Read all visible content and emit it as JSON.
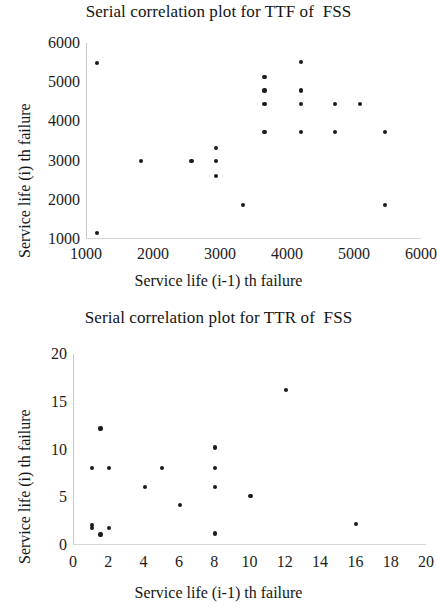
{
  "page": {
    "background": "#ffffff",
    "marker_color": "#1b1b1b",
    "axis_color": "#c9c9c9",
    "text_color": "#1a1a1a"
  },
  "figures": [
    {
      "id": "ttf",
      "title": "Serial correlation plot for TTF of  FSS",
      "xlabel": "Service life (i-1) th failure",
      "ylabel": "Service life (i) th failure"
    },
    {
      "id": "ttr",
      "title": "Serial correlation plot for TTR of  FSS",
      "xlabel": "Service life (i-1) th failure",
      "ylabel": "Service life (i) th failure"
    }
  ],
  "chart_data": [
    {
      "type": "scatter",
      "title": "Serial correlation plot for TTF of  FSS",
      "xlabel": "Service life (i-1) th failure",
      "ylabel": "Service life (i) th failure",
      "xlim": [
        1000,
        6000
      ],
      "ylim": [
        1000,
        6000
      ],
      "xticks": [
        1000,
        2000,
        3000,
        4000,
        5000,
        6000
      ],
      "yticks": [
        1000,
        2000,
        3000,
        4000,
        5000,
        6000
      ],
      "xticklabels": [
        "1000",
        "2000",
        "3000",
        "4000",
        "5000",
        "6000"
      ],
      "yticklabels": [
        "1000",
        "2000",
        "3000",
        "4000",
        "5000",
        "6000"
      ],
      "grid": false,
      "legend": null,
      "points": [
        [
          1150,
          5500
        ],
        [
          1150,
          1150
        ],
        [
          1800,
          2980
        ],
        [
          2560,
          2980
        ],
        [
          2930,
          3330
        ],
        [
          2930,
          2980
        ],
        [
          2930,
          2610
        ],
        [
          3330,
          1860
        ],
        [
          3650,
          5130
        ],
        [
          3650,
          4790
        ],
        [
          3650,
          4440
        ],
        [
          3650,
          3720
        ],
        [
          4200,
          5520
        ],
        [
          4200,
          4790
        ],
        [
          4200,
          4440
        ],
        [
          4200,
          3720
        ],
        [
          4700,
          4440
        ],
        [
          4700,
          3720
        ],
        [
          5080,
          4440
        ],
        [
          5450,
          3720
        ],
        [
          5450,
          1860
        ]
      ]
    },
    {
      "type": "scatter",
      "title": "Serial correlation plot for TTR of  FSS",
      "xlabel": "Service life (i-1) th failure",
      "ylabel": "Service life (i) th failure",
      "xlim": [
        0,
        20
      ],
      "ylim": [
        0,
        20
      ],
      "xticks": [
        0,
        2,
        4,
        6,
        8,
        10,
        12,
        14,
        16,
        18,
        20
      ],
      "yticks": [
        0,
        5,
        10,
        15,
        20
      ],
      "xticklabels": [
        "0",
        "2",
        "4",
        "6",
        "8",
        "10",
        "12",
        "14",
        "16",
        "18",
        "20"
      ],
      "yticklabels": [
        "0",
        "5",
        "10",
        "15",
        "20"
      ],
      "grid": false,
      "legend": null,
      "points": [
        [
          1.0,
          8.1
        ],
        [
          1.0,
          2.1
        ],
        [
          1.0,
          1.8
        ],
        [
          1.5,
          12.2
        ],
        [
          1.5,
          1.1
        ],
        [
          2.0,
          8.1
        ],
        [
          2.0,
          1.8
        ],
        [
          4.0,
          6.1
        ],
        [
          5.0,
          8.1
        ],
        [
          6.0,
          4.2
        ],
        [
          8.0,
          10.2
        ],
        [
          8.0,
          8.1
        ],
        [
          8.0,
          6.1
        ],
        [
          8.0,
          1.2
        ],
        [
          10.0,
          5.1
        ],
        [
          12.0,
          16.2
        ],
        [
          16.0,
          2.2
        ]
      ]
    }
  ]
}
